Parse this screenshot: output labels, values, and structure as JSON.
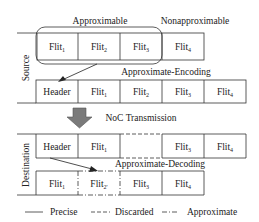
{
  "diagram": {
    "top_labels": {
      "approximable": "Approximable",
      "nonapproximable": "Nonapproximable"
    },
    "side_labels": {
      "source": "Source",
      "destination": "Destination"
    },
    "steps": {
      "encoding": "Approximate-Encoding",
      "transmission": "NoC Transmission",
      "decoding": "Approximate-Decoding"
    },
    "rows": {
      "source_flits": [
        {
          "base": "Flit",
          "sub": "1",
          "style": "precise"
        },
        {
          "base": "Flit",
          "sub": "2",
          "style": "precise"
        },
        {
          "base": "Flit",
          "sub": "3",
          "style": "precise"
        },
        {
          "base": "Flit",
          "sub": "4",
          "style": "precise"
        }
      ],
      "encoded_packet": [
        {
          "base": "Header",
          "sub": "",
          "style": "precise"
        },
        {
          "base": "Flit",
          "sub": "1",
          "style": "precise"
        },
        {
          "base": "Flit",
          "sub": "2",
          "style": "precise"
        },
        {
          "base": "Flit",
          "sub": "3",
          "style": "precise"
        },
        {
          "base": "Flit",
          "sub": "4",
          "style": "precise"
        }
      ],
      "received_packet": [
        {
          "base": "Header",
          "sub": "",
          "style": "precise"
        },
        {
          "base": "Flit",
          "sub": "1",
          "style": "precise"
        },
        {
          "base": "",
          "sub": "",
          "style": "discarded"
        },
        {
          "base": "Flit",
          "sub": "3",
          "style": "precise"
        },
        {
          "base": "Flit",
          "sub": "4",
          "style": "precise"
        }
      ],
      "decoded_flits": [
        {
          "base": "Flit",
          "sub": "1",
          "style": "precise"
        },
        {
          "base": "Flit",
          "sub": "2'",
          "style": "approximate"
        },
        {
          "base": "Flit",
          "sub": "3",
          "style": "precise"
        },
        {
          "base": "Flit",
          "sub": "4",
          "style": "precise"
        }
      ]
    },
    "legend": [
      {
        "style": "precise",
        "label": "Precise"
      },
      {
        "style": "discarded",
        "label": "Discarded"
      },
      {
        "style": "approximate",
        "label": "Approximate"
      }
    ],
    "colors": {
      "line": "#333333",
      "arrow_fill": "#7a7a7a",
      "text": "#222222"
    }
  }
}
